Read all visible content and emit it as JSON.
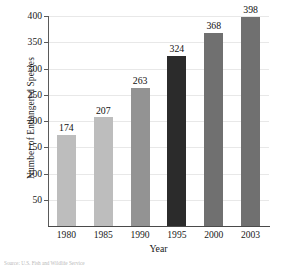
{
  "chart_data": {
    "type": "bar",
    "title": "",
    "xlabel": "Year",
    "ylabel": "Number of Endangered Species",
    "categories": [
      "1980",
      "1985",
      "1990",
      "1995",
      "2000",
      "2003"
    ],
    "values": [
      174,
      207,
      263,
      324,
      368,
      398
    ],
    "value_labels": [
      "174",
      "207",
      "263",
      "324",
      "368",
      "398"
    ],
    "bar_colors": [
      "#bdbdbd",
      "#bdbdbd",
      "#939393",
      "#2b2b2b",
      "#707070",
      "#707070"
    ],
    "ylim": [
      0,
      400
    ],
    "yticks": [
      50,
      100,
      150,
      200,
      250,
      300,
      350,
      400
    ],
    "ytick_labels": [
      "50",
      "100",
      "150",
      "200",
      "250",
      "300",
      "350",
      "400"
    ],
    "grid": true,
    "grid_axis": "y",
    "legend": "none",
    "axis_color": "#4a4a4a",
    "gridline_color": "#e8e8e8",
    "background": "#ffffff"
  },
  "caption": {
    "remnant": "Source: U.S. Fish and Wildlife Service"
  }
}
